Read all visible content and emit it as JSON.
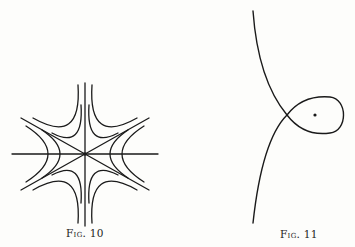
{
  "figures": [
    {
      "id": "fig10",
      "caption": "Fig. 10",
      "description": "Family of hyperbola-like curves arranged in six sectors around a central point, bounded by horizontal, vertical and two diagonal lines through the origin",
      "center": [
        85,
        154
      ],
      "stroke_color": "#1a1a1a"
    },
    {
      "id": "fig11",
      "caption": "Fig. 11",
      "description": "Curve with a self-intersection forming a loop, with a dot inside the loop",
      "crossing_point": [
        287,
        115
      ],
      "dot": [
        315,
        115
      ],
      "stroke_color": "#1a1a1a"
    }
  ]
}
